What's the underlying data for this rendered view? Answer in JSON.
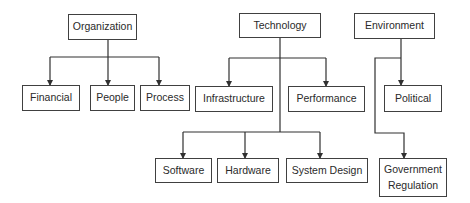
{
  "diagram": {
    "type": "hierarchy",
    "colors": {
      "line": "#303030",
      "border": "#404040",
      "text": "#2a2a2a",
      "background": "#ffffff"
    },
    "nodes": {
      "organization": {
        "label": "Organization"
      },
      "financial": {
        "label": "Financial"
      },
      "people": {
        "label": "People"
      },
      "process": {
        "label": "Process"
      },
      "technology": {
        "label": "Technology"
      },
      "infrastructure": {
        "label": "Infrastructure"
      },
      "performance": {
        "label": "Performance"
      },
      "software": {
        "label": "Software"
      },
      "hardware": {
        "label": "Hardware"
      },
      "system_design": {
        "label": "System Design"
      },
      "environment": {
        "label": "Environment"
      },
      "political": {
        "label": "Political"
      },
      "government_regulation": {
        "label": "Government\nRegulation"
      }
    },
    "edges": [
      [
        "Organization",
        "Financial"
      ],
      [
        "Organization",
        "People"
      ],
      [
        "Organization",
        "Process"
      ],
      [
        "Technology",
        "Infrastructure"
      ],
      [
        "Technology",
        "Performance"
      ],
      [
        "Technology",
        "Software"
      ],
      [
        "Technology",
        "Hardware"
      ],
      [
        "Technology",
        "System Design"
      ],
      [
        "Environment",
        "Political"
      ],
      [
        "Environment",
        "Government Regulation"
      ]
    ]
  }
}
